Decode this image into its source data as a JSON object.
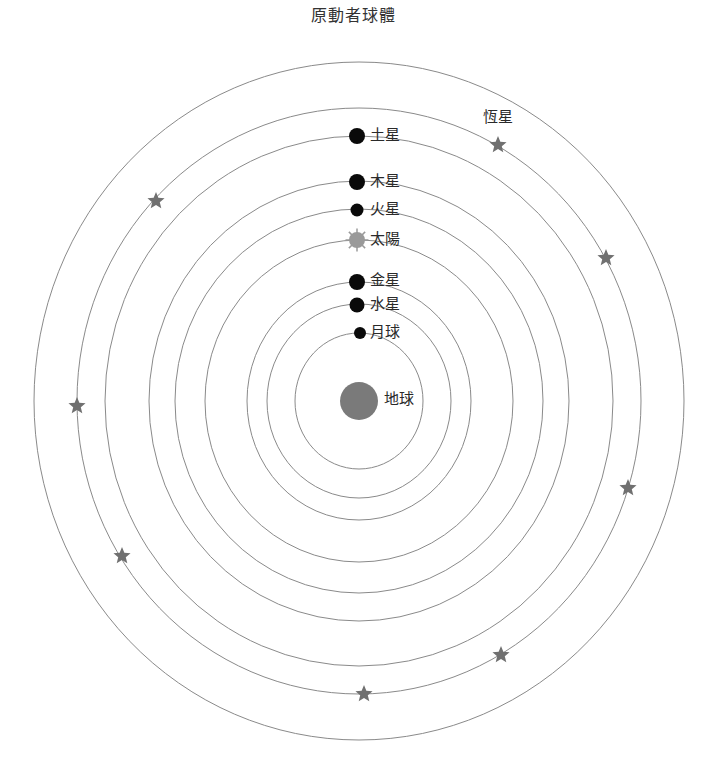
{
  "title": "原動者球體",
  "center": {
    "x": 359,
    "y": 401
  },
  "colors": {
    "orbit": "#8a8a8a",
    "planet": "#0a0a0a",
    "sun": "#9a9a9a",
    "earth": "#7a7a7a",
    "star": "#707070",
    "text": "#2a2a2a"
  },
  "orbits": [
    {
      "name": "prime-mover",
      "rx": 325,
      "ry": 339
    },
    {
      "name": "fixed-stars",
      "rx": 282,
      "ry": 293
    },
    {
      "name": "saturn",
      "rx": 254,
      "ry": 265
    },
    {
      "name": "jupiter",
      "rx": 210,
      "ry": 220
    },
    {
      "name": "mars",
      "rx": 184,
      "ry": 192
    },
    {
      "name": "sun",
      "rx": 154,
      "ry": 161
    },
    {
      "name": "venus",
      "rx": 112,
      "ry": 119
    },
    {
      "name": "mercury",
      "rx": 92,
      "ry": 97
    },
    {
      "name": "moon",
      "rx": 64,
      "ry": 68
    }
  ],
  "bodies": [
    {
      "id": "saturn",
      "label": "土星",
      "x": 357,
      "y": 136,
      "r": 8,
      "type": "planet"
    },
    {
      "id": "jupiter",
      "label": "木星",
      "x": 357,
      "y": 182,
      "r": 8,
      "type": "planet"
    },
    {
      "id": "mars",
      "label": "火星",
      "x": 357,
      "y": 210,
      "r": 6.5,
      "type": "planet"
    },
    {
      "id": "sun",
      "label": "太陽",
      "x": 357,
      "y": 240,
      "r": 8,
      "type": "sun"
    },
    {
      "id": "venus",
      "label": "金星",
      "x": 357,
      "y": 282,
      "r": 8,
      "type": "planet"
    },
    {
      "id": "mercury",
      "label": "水星",
      "x": 357,
      "y": 305,
      "r": 7.5,
      "type": "planet"
    },
    {
      "id": "moon",
      "label": "月球",
      "x": 360,
      "y": 333,
      "r": 6,
      "type": "planet"
    },
    {
      "id": "earth",
      "label": "地球",
      "x": 359,
      "y": 401,
      "r": 19,
      "type": "earth"
    }
  ],
  "fixed_stars": {
    "label": "恆星",
    "label_pos": {
      "x": 483,
      "y": 115
    },
    "positions": [
      {
        "x": 498,
        "y": 145
      },
      {
        "x": 156,
        "y": 201
      },
      {
        "x": 606,
        "y": 258
      },
      {
        "x": 77,
        "y": 406
      },
      {
        "x": 628,
        "y": 488
      },
      {
        "x": 122,
        "y": 556
      },
      {
        "x": 501,
        "y": 655
      },
      {
        "x": 364,
        "y": 694
      }
    ]
  }
}
